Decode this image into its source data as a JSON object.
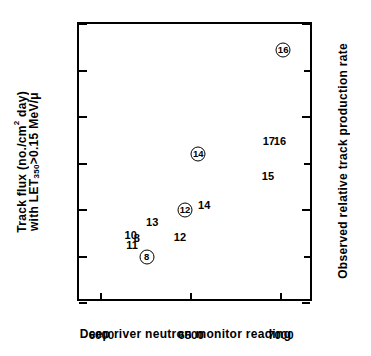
{
  "chart_data": {
    "type": "scatter",
    "title": "",
    "xlabel": "Deep river neutron monitor reading",
    "ylabel_left_line1": "Track flux (no./cm2 day)",
    "ylabel_left_line2": "with LET350>0.15 MeV/μ",
    "ylabel_right": "Observed relative track production rate",
    "xlim": [
      5875,
      7185
    ],
    "ylim_left": [
      0,
      3.0
    ],
    "ylim_right": [
      0,
      3
    ],
    "grid": false,
    "legend": false,
    "x_ticks": [
      6000,
      6500,
      7000
    ],
    "x_tick_labels": [
      "6000",
      "6500",
      "7000"
    ],
    "y_ticks_left": [
      0,
      0.5,
      1.0,
      1.5,
      2.0,
      2.5,
      3.0
    ],
    "y_tick_labels_left": [
      "0",
      "0.5",
      "1.0",
      "1.5",
      "2.0",
      "2.5",
      "3.0"
    ],
    "y_ticks_right": [
      0,
      1,
      2,
      3
    ],
    "y_tick_labels_right": [
      "0",
      "1",
      "2",
      "3"
    ],
    "y_minor_ticks_right": [
      0.5,
      1.5,
      2.5
    ],
    "series": [
      {
        "name": "Measured track flux (circled)",
        "marker": "circled-number",
        "points": [
          {
            "label": "8",
            "x": 6252,
            "y": 0.5
          },
          {
            "label": "12",
            "x": 6466,
            "y": 1.0
          },
          {
            "label": "14",
            "x": 6540,
            "y": 1.6
          },
          {
            "label": "16",
            "x": 7013,
            "y": 2.72
          }
        ]
      },
      {
        "name": "Predicted values (plain numbers)",
        "marker": "text",
        "points": [
          {
            "label": "10",
            "x": 6163,
            "y": 0.73
          },
          {
            "label": "8",
            "x": 6197,
            "y": 0.7
          },
          {
            "label": "11",
            "x": 6171,
            "y": 0.62
          },
          {
            "label": "13",
            "x": 6283,
            "y": 0.87
          },
          {
            "label": "12",
            "x": 6438,
            "y": 0.71
          },
          {
            "label": "14",
            "x": 6573,
            "y": 1.05
          },
          {
            "label": "15",
            "x": 6928,
            "y": 1.37
          },
          {
            "label": "17",
            "x": 6933,
            "y": 1.74
          },
          {
            "label": "16",
            "x": 6995,
            "y": 1.74
          }
        ]
      }
    ]
  },
  "axis": {
    "x_title": "Deep river neutron monitor reading",
    "y_left_line1": "Track flux (no./cm",
    "y_left_line1_sup": "2",
    "y_left_line1_tail": " day)",
    "y_left_line2_head": "with LET",
    "y_left_line2_sub": "350",
    "y_left_line2_tail": ">0.15 MeV/μ",
    "y_right_title": "Observed relative track production rate"
  }
}
